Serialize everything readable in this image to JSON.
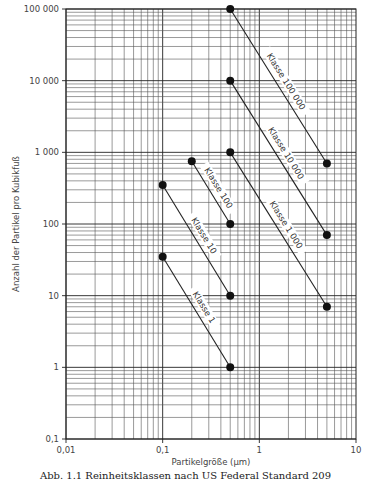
{
  "chart_data": {
    "type": "line",
    "title": "",
    "xlabel": "Partikelgröße (µm)",
    "ylabel": "Anzahl der Partikel pro Kubikfuß",
    "xscale": "log",
    "yscale": "log",
    "xlim": [
      0.01,
      10
    ],
    "ylim": [
      0.1,
      100000
    ],
    "grid": true,
    "x_ticks": [
      {
        "value": 0.01,
        "label": "0,01"
      },
      {
        "value": 0.1,
        "label": "0,1"
      },
      {
        "value": 1,
        "label": "1"
      },
      {
        "value": 10,
        "label": "10"
      }
    ],
    "y_ticks": [
      {
        "value": 0.1,
        "label": "0,1"
      },
      {
        "value": 1,
        "label": "1"
      },
      {
        "value": 10,
        "label": "10"
      },
      {
        "value": 100,
        "label": "100"
      },
      {
        "value": 1000,
        "label": "1 000"
      },
      {
        "value": 10000,
        "label": "10 000"
      },
      {
        "value": 100000,
        "label": "100 000"
      }
    ],
    "series": [
      {
        "name": "Klasse 100 000",
        "points": [
          [
            0.5,
            100000
          ],
          [
            5,
            700
          ]
        ]
      },
      {
        "name": "Klasse 10 000",
        "points": [
          [
            0.5,
            10000
          ],
          [
            5,
            70
          ]
        ]
      },
      {
        "name": "Klasse 1 000",
        "points": [
          [
            0.5,
            1000
          ],
          [
            5,
            7
          ]
        ]
      },
      {
        "name": "Klasse 100",
        "points": [
          [
            0.2,
            750
          ],
          [
            0.5,
            100
          ]
        ]
      },
      {
        "name": "Klasse 10",
        "points": [
          [
            0.1,
            350
          ],
          [
            0.5,
            10
          ]
        ]
      },
      {
        "name": "Klasse 1",
        "points": [
          [
            0.1,
            35
          ],
          [
            0.5,
            1
          ]
        ]
      }
    ],
    "legend": "inline labels along lines"
  },
  "caption": "Abb. 1.1 Reinheitsklassen nach US Federal Standard 209"
}
